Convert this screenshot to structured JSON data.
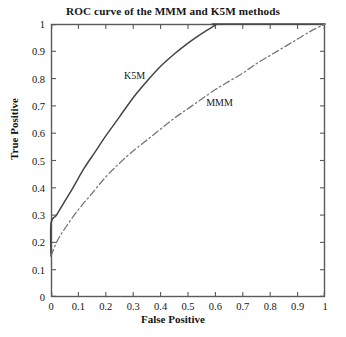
{
  "chart_data": {
    "type": "line",
    "title": "ROC curve of the MMM and K5M methods",
    "xlabel": "False Positive",
    "ylabel": "True Positive",
    "xlim": [
      0,
      1
    ],
    "ylim": [
      0,
      1
    ],
    "grid": false,
    "legend_position": "inline-annotations",
    "xticks": [
      "0",
      "0.1",
      "0.2",
      "0.3",
      "0.4",
      "0.5",
      "0.6",
      "0.7",
      "0.8",
      "0.9",
      "1"
    ],
    "xtick_values": [
      0,
      0.1,
      0.2,
      0.3,
      0.4,
      0.5,
      0.6,
      0.7,
      0.8,
      0.9,
      1
    ],
    "yticks": [
      "0",
      "0.1",
      "0.2",
      "0.3",
      "0.4",
      "0.5",
      "0.6",
      "0.7",
      "0.8",
      "0.9",
      "1"
    ],
    "ytick_values": [
      0,
      0.1,
      0.2,
      0.3,
      0.4,
      0.5,
      0.6,
      0.7,
      0.8,
      0.9,
      1
    ],
    "series": [
      {
        "name": "K5M",
        "style": "solid",
        "color": "#444444",
        "annotation_label": "K5M",
        "annotation_x": 0.305,
        "annotation_y": 0.815,
        "x": [
          0,
          0,
          0.02,
          0.05,
          0.08,
          0.12,
          0.16,
          0.2,
          0.25,
          0.3,
          0.35,
          0.4,
          0.45,
          0.5,
          0.55,
          0.6,
          0.62,
          1.0
        ],
        "y": [
          0.15,
          0.27,
          0.3,
          0.35,
          0.4,
          0.47,
          0.53,
          0.59,
          0.66,
          0.73,
          0.79,
          0.845,
          0.89,
          0.93,
          0.965,
          0.995,
          1.0,
          1.0
        ]
      },
      {
        "name": "MMM",
        "style": "dash-dot",
        "color": "#777777",
        "annotation_label": "MMM",
        "annotation_x": 0.615,
        "annotation_y": 0.715,
        "x": [
          0,
          0.02,
          0.05,
          0.1,
          0.15,
          0.2,
          0.25,
          0.3,
          0.35,
          0.4,
          0.45,
          0.5,
          0.55,
          0.6,
          0.65,
          0.7,
          0.75,
          0.8,
          0.85,
          0.9,
          0.95,
          1.0
        ],
        "y": [
          0.15,
          0.2,
          0.25,
          0.32,
          0.38,
          0.44,
          0.49,
          0.535,
          0.575,
          0.615,
          0.655,
          0.69,
          0.725,
          0.76,
          0.79,
          0.82,
          0.855,
          0.885,
          0.915,
          0.945,
          0.975,
          1.0
        ]
      }
    ]
  },
  "style": {
    "frame_color": "#5a5a5a",
    "background": "#ffffff",
    "text_color": "#161616"
  }
}
